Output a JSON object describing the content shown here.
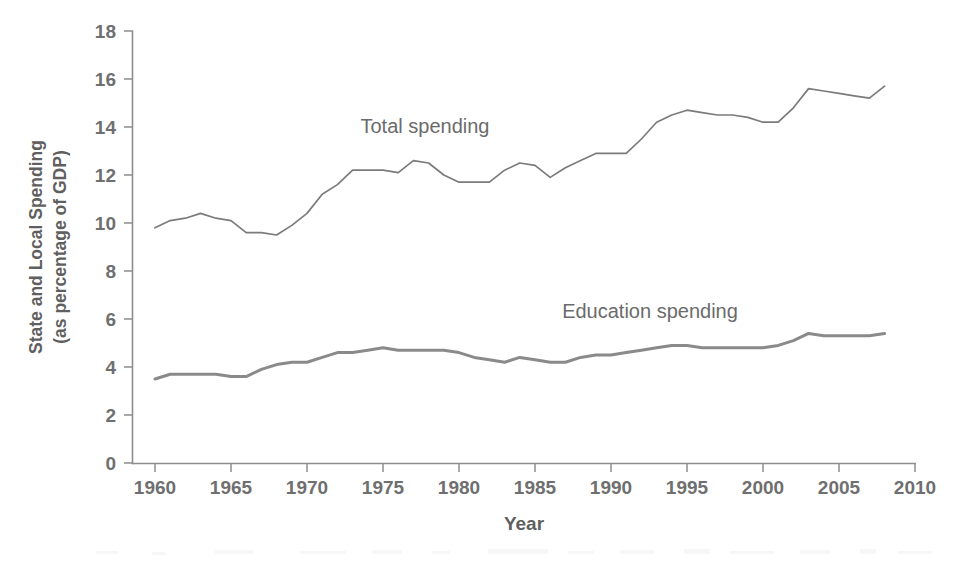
{
  "figure": {
    "background_color": "#ffffff",
    "width": 963,
    "height": 564
  },
  "axes": {
    "y_title_line1": "State and Local Spending",
    "y_title_line2": "(as percentage of GDP)",
    "x_title": "Year"
  },
  "annotations": {
    "total_label": "Total spending",
    "education_label": "Education spending"
  },
  "chart_data": {
    "type": "line",
    "title": "",
    "subtitle": "",
    "xlabel": "Year",
    "ylabel": "State and Local Spending (as percentage of GDP)",
    "xlim": [
      1958,
      2010
    ],
    "ylim": [
      0,
      18
    ],
    "xticks": [
      1960,
      1965,
      1970,
      1975,
      1980,
      1985,
      1990,
      1995,
      2000,
      2005,
      2010
    ],
    "xtick_labels": [
      "1960",
      "1965",
      "1970",
      "1975",
      "1980",
      "1985",
      "1990",
      "1995",
      "2000",
      "2005",
      "2010"
    ],
    "yticks": [
      0,
      2,
      4,
      6,
      8,
      10,
      12,
      14,
      16,
      18
    ],
    "ytick_labels": [
      "0",
      "2",
      "4",
      "6",
      "8",
      "10",
      "12",
      "14",
      "16",
      "18"
    ],
    "grid": false,
    "legend": "inline-annotations",
    "legend_position": "on-plot",
    "colors": {
      "total_spending": "#7b7b7b",
      "education_spending": "#8a8a8a",
      "axis": "#8e8e8e",
      "text": "#6f6f6f"
    },
    "x": [
      1960,
      1961,
      1962,
      1963,
      1964,
      1965,
      1966,
      1967,
      1968,
      1969,
      1970,
      1971,
      1972,
      1973,
      1974,
      1975,
      1976,
      1977,
      1978,
      1979,
      1980,
      1981,
      1982,
      1983,
      1984,
      1985,
      1986,
      1987,
      1988,
      1989,
      1990,
      1991,
      1992,
      1993,
      1994,
      1995,
      1996,
      1997,
      1998,
      1999,
      2000,
      2001,
      2002,
      2003,
      2004,
      2005,
      2006,
      2007,
      2008
    ],
    "series": [
      {
        "name": "Total spending",
        "label": "Total spending",
        "color": "#7b7b7b",
        "linewidth": 1.7,
        "values": [
          9.8,
          10.1,
          10.2,
          10.4,
          10.2,
          10.1,
          9.6,
          9.6,
          9.5,
          9.9,
          10.4,
          11.2,
          11.6,
          12.2,
          12.2,
          12.2,
          12.1,
          12.6,
          12.5,
          12.0,
          11.7,
          11.7,
          11.7,
          12.2,
          12.5,
          12.4,
          11.9,
          12.3,
          12.6,
          12.9,
          12.9,
          12.9,
          13.5,
          14.2,
          14.5,
          14.7,
          14.6,
          14.5,
          14.5,
          14.4,
          14.2,
          14.2,
          14.8,
          15.6,
          15.5,
          15.4,
          15.3,
          15.2,
          15.7
        ]
      },
      {
        "name": "Education spending",
        "label": "Education spending",
        "color": "#8a8a8a",
        "linewidth": 3.0,
        "values": [
          3.5,
          3.7,
          3.7,
          3.7,
          3.7,
          3.6,
          3.6,
          3.9,
          4.1,
          4.2,
          4.2,
          4.4,
          4.6,
          4.6,
          4.7,
          4.8,
          4.7,
          4.7,
          4.7,
          4.7,
          4.6,
          4.4,
          4.3,
          4.2,
          4.4,
          4.3,
          4.2,
          4.2,
          4.4,
          4.5,
          4.5,
          4.6,
          4.7,
          4.8,
          4.9,
          4.9,
          4.8,
          4.8,
          4.8,
          4.8,
          4.8,
          4.9,
          5.1,
          5.4,
          5.3,
          5.3,
          5.3,
          5.3,
          5.4
        ]
      }
    ]
  }
}
